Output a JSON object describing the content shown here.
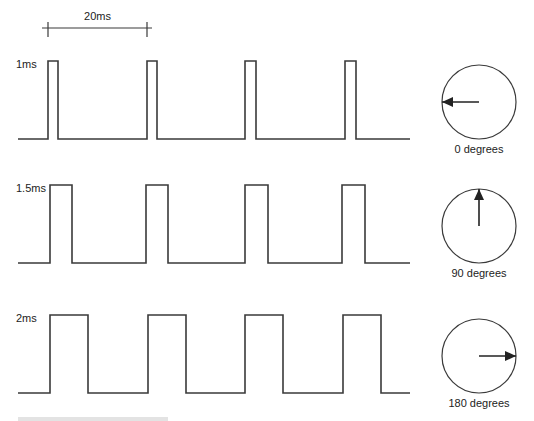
{
  "period_marker": {
    "label": "20ms",
    "x_start": 48,
    "x_end": 147,
    "line_y": 28
  },
  "rows": [
    {
      "pulse_label": "1ms",
      "pulse_width_ms": 1,
      "top_y": 61,
      "base_y": 139,
      "pulses": [
        [
          48,
          58
        ],
        [
          147,
          157
        ],
        [
          245,
          256
        ],
        [
          345,
          356
        ]
      ],
      "dial": {
        "cx": 479,
        "cy": 102,
        "r": 37,
        "angle_label": "0 degrees",
        "needle_direction": "left"
      }
    },
    {
      "pulse_label": "1.5ms",
      "pulse_width_ms": 1.5,
      "top_y": 185,
      "base_y": 263,
      "pulses": [
        [
          50,
          72
        ],
        [
          146,
          168
        ],
        [
          245,
          268
        ],
        [
          342,
          365
        ]
      ],
      "dial": {
        "cx": 479,
        "cy": 226,
        "r": 37,
        "angle_label": "90 degrees",
        "needle_direction": "up"
      }
    },
    {
      "pulse_label": "2ms",
      "pulse_width_ms": 2,
      "top_y": 315,
      "base_y": 393,
      "pulses": [
        [
          50,
          88
        ],
        [
          148,
          186
        ],
        [
          245,
          283
        ],
        [
          343,
          381
        ]
      ],
      "dial": {
        "cx": 479,
        "cy": 356,
        "r": 37,
        "angle_label": "180 degrees",
        "needle_direction": "right"
      }
    }
  ],
  "wave_x_start": 18,
  "wave_x_end": 410,
  "colors": {
    "line": "#3a3a3a",
    "text": "#222222",
    "background": "#ffffff"
  }
}
